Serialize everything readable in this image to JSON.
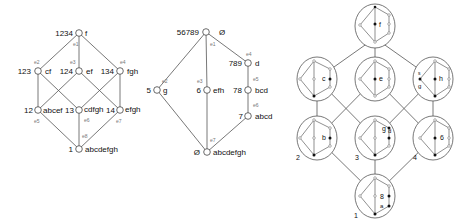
{
  "panel1": {
    "nodes": [
      {
        "id": "1234",
        "ext": "f"
      },
      {
        "id": "123",
        "ext": "cf"
      },
      {
        "id": "124",
        "ext": "ef"
      },
      {
        "id": "134",
        "ext": "fgh"
      },
      {
        "id": "12",
        "ext": "abcef"
      },
      {
        "id": "13",
        "ext": "cdfgh"
      },
      {
        "id": "14",
        "ext": "efgh"
      },
      {
        "id": "1",
        "ext": "abcdefgh"
      }
    ],
    "edge_labels": [
      "e1",
      "e2",
      "e3",
      "e4",
      "e5",
      "e6",
      "e7",
      "e8"
    ]
  },
  "panel2": {
    "nodes": [
      {
        "id": "56789",
        "ext": "Ø"
      },
      {
        "id": "789",
        "ext": "d"
      },
      {
        "id": "5",
        "ext": "g"
      },
      {
        "id": "6",
        "ext": "efh"
      },
      {
        "id": "78",
        "ext": "bcd"
      },
      {
        "id": "7",
        "ext": "abcd"
      },
      {
        "id": "Ø",
        "ext": "abcdefgh"
      }
    ],
    "edge_labels": [
      "e1",
      "e2",
      "e3",
      "e4",
      "e5",
      "e6",
      "e7"
    ]
  },
  "panel3": {
    "concepts": [
      {
        "pos": "top",
        "letters": "f"
      },
      {
        "pos": "mid-left",
        "letters": "c"
      },
      {
        "pos": "mid-center",
        "letters": "e"
      },
      {
        "pos": "mid-right",
        "letters": "h, s, g"
      },
      {
        "pos": "low-left",
        "letters": "b",
        "number": "2"
      },
      {
        "pos": "low-center",
        "letters": "g d",
        "number": "3"
      },
      {
        "pos": "low-right",
        "letters": "6",
        "number": "4"
      },
      {
        "pos": "bottom",
        "letters": "8, a",
        "number": "1"
      }
    ]
  }
}
